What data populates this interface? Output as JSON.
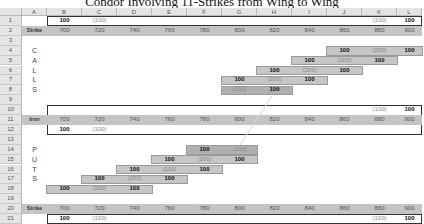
{
  "title": "Condor Involving 11-Strikes from Wing to Wing",
  "columns": [
    "A",
    "B",
    "C",
    "D",
    "E",
    "F",
    "G",
    "H",
    "I",
    "J",
    "K",
    "L"
  ],
  "rows": [
    "1",
    "2",
    "3",
    "4",
    "5",
    "6",
    "7",
    "8",
    "9",
    "10",
    "11",
    "12",
    "13",
    "14",
    "15",
    "16",
    "17",
    "18",
    "19",
    "20",
    "21"
  ],
  "strikes": [
    "700",
    "720",
    "740",
    "760",
    "780",
    "800",
    "820",
    "840",
    "860",
    "880",
    "900"
  ],
  "labels": {
    "strike_top": "Strike",
    "iron": "Iron",
    "strike_bottom": "Strike",
    "calls": [
      "C",
      "A",
      "L",
      "L",
      "S"
    ],
    "puts": [
      "P",
      "U",
      "T",
      "S"
    ]
  },
  "row1": {
    "B": "100",
    "C": "(100)",
    "K": "(100)",
    "L": "100"
  },
  "row10": {
    "K": "(100)",
    "L": "100"
  },
  "row12": {
    "B": "100",
    "C": "(100)"
  },
  "row21": {
    "B": "100",
    "C": "(100)",
    "K": "(100)",
    "L": "100"
  },
  "call_rows": [
    {
      "row": 4,
      "cells": {
        "J": "100",
        "K": "(200)",
        "L": "100"
      }
    },
    {
      "row": 5,
      "cells": {
        "I": "100",
        "J": "(200)",
        "K": "100"
      }
    },
    {
      "row": 6,
      "cells": {
        "H": "100",
        "I": "(200)",
        "J": "100"
      }
    },
    {
      "row": 7,
      "cells": {
        "G": "100",
        "H": "(200)",
        "I": "100"
      }
    },
    {
      "row": 8,
      "cells": {
        "G": "(100)",
        "H": "100"
      }
    }
  ],
  "put_rows": [
    {
      "row": 14,
      "cells": {
        "F": "100",
        "G": "(100)"
      }
    },
    {
      "row": 15,
      "cells": {
        "E": "100",
        "F": "(200)",
        "G": "100"
      }
    },
    {
      "row": 16,
      "cells": {
        "D": "100",
        "E": "(200)",
        "F": "100"
      }
    },
    {
      "row": 17,
      "cells": {
        "C": "100",
        "D": "(200)",
        "E": "100"
      }
    },
    {
      "row": 18,
      "cells": {
        "B": "100",
        "C": "(200)",
        "D": "100"
      }
    }
  ],
  "colors": {
    "header_bg": "#e4e4e4",
    "strike_row_bg": "#c4c4c4",
    "bar_bg": "#c6c6c6",
    "bar_border": "#9a9a9a",
    "negative_text": "#888888",
    "positive_text": "#111111"
  }
}
